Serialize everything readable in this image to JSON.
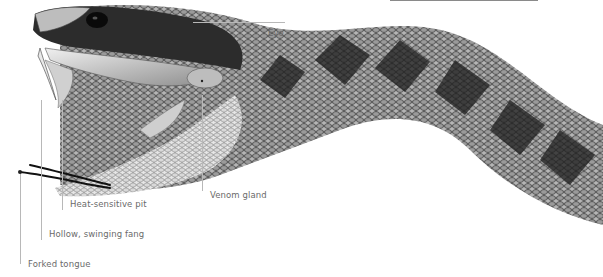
{
  "diagram": {
    "labels": [
      {
        "id": "eye",
        "text": "Eye"
      },
      {
        "id": "venom-gland",
        "text": "Venom gland"
      },
      {
        "id": "heat-sensitive-pit",
        "text": "Heat-sensitive pit"
      },
      {
        "id": "hollow-swinging-fang",
        "text": "Hollow, swinging fang"
      },
      {
        "id": "forked-tongue",
        "text": "Forked tongue"
      }
    ]
  },
  "colors": {
    "background": "#ffffff",
    "label_text": "#6a6a6a",
    "leader_line": "#b8b8b8",
    "scale_dark": "#2a2a2a",
    "scale_light": "#d8d8d8"
  }
}
